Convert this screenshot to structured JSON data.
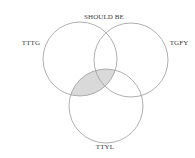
{
  "diagram": {
    "type": "venn",
    "sets": [
      {
        "id": "tttg",
        "label": "TTTG",
        "cx": 80,
        "cy": 59,
        "r": 37,
        "label_x": 31,
        "label_y": 45,
        "anchor": "middle"
      },
      {
        "id": "tgfy",
        "label": "TGFY",
        "cx": 131,
        "cy": 60,
        "r": 37,
        "label_x": 179,
        "label_y": 45,
        "anchor": "middle"
      },
      {
        "id": "ttyl",
        "label": "TTYL",
        "cx": 106,
        "cy": 106,
        "r": 37,
        "label_x": 105,
        "label_y": 149,
        "anchor": "middle"
      }
    ],
    "top_label": {
      "text": "SHOULD BE",
      "x": 104,
      "y": 19
    },
    "highlighted_region": {
      "sets": [
        "tttg",
        "ttyl"
      ],
      "fill": "#d9d9d9"
    },
    "colors": {
      "stroke": "#9a9a9a",
      "background": "#ffffff",
      "text": "#3a3a3a"
    }
  }
}
